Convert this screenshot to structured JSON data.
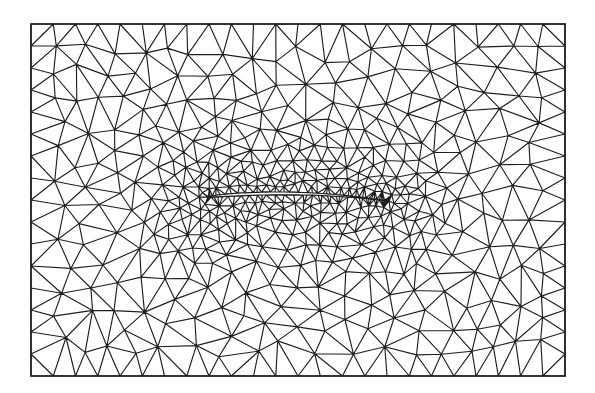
{
  "figure": {
    "type": "unstructured-triangular-mesh",
    "background_color": "#ffffff",
    "line_color": "#1e1e1e"
  },
  "domain": {
    "shape": "rectangle",
    "x0": 31,
    "y0": 24,
    "x1": 565,
    "y1": 376
  },
  "airfoil": {
    "leading_edge": [
      208,
      197
    ],
    "trailing_edge": [
      389,
      201
    ],
    "max_thickness": 17,
    "camber": 5,
    "refinement": "dense near leading and trailing edges"
  },
  "mesh": {
    "far_field_spacing": 26,
    "near_field_spacing": 7,
    "seed": 7
  }
}
